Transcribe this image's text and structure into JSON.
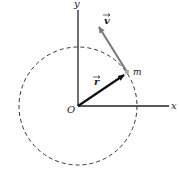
{
  "diagram": {
    "labels": {
      "y_axis": "y",
      "x_axis": "x",
      "origin": "O",
      "mass": "m",
      "position_vector": "r",
      "velocity_vector": "v"
    },
    "colors": {
      "axes": "#222222",
      "circle": "#333333",
      "position_vector": "#111111",
      "velocity_vector": "#777777",
      "mass_point": "#aaaaaa"
    }
  }
}
